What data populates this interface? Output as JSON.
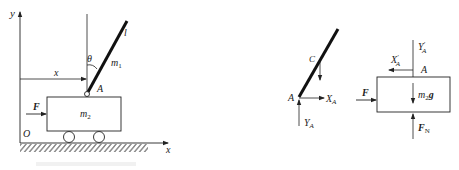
{
  "figure_left": {
    "title": "Cart with inverted pendulum",
    "axes": {
      "x_label": "x",
      "y_label": "y",
      "origin_label": "O"
    },
    "position_label": "x",
    "angle_label": "θ",
    "rod": {
      "mass_label": "m",
      "mass_sub": "1",
      "length_label": "l"
    },
    "pivot_label": "A",
    "cart": {
      "mass_label": "m",
      "mass_sub": "2"
    },
    "force_label": "F",
    "caption": ""
  },
  "figure_right_rod": {
    "center_label": "C",
    "pivot_label": "A",
    "force_x": {
      "label": "X",
      "sub": "A"
    },
    "force_y": {
      "label": "Y",
      "sub": "A"
    }
  },
  "figure_right_cart": {
    "pivot_label": "A",
    "force_x": {
      "label": "X",
      "prime": "′",
      "sub": "A"
    },
    "force_y": {
      "label": "Y",
      "prime": "′",
      "sub": "A"
    },
    "applied_force": "F",
    "weight": {
      "label": "m",
      "sub": "2",
      "suffix": "g"
    },
    "normal_force": {
      "label": "F",
      "sub": "N"
    }
  },
  "colors": {
    "line": "#222222",
    "hatch": "#333333",
    "background": "#ffffff"
  }
}
